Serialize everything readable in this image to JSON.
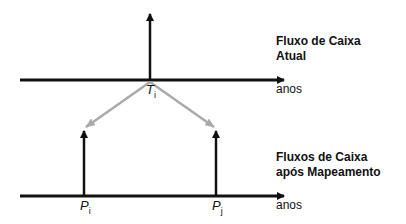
{
  "top": {
    "title_line1": "Fluxo de Caixa",
    "title_line2": "Atual",
    "axis_label": "anos",
    "point_main": "T",
    "point_sub": "i"
  },
  "bottom": {
    "title_line1": "Fluxos de Caixa",
    "title_line2": "após Mapeamento",
    "axis_label": "anos",
    "p1_main": "P",
    "p1_sub": "i",
    "p2_main": "P",
    "p2_sub": "j"
  },
  "colors": {
    "axis": "#111111",
    "mapping_arrow": "#aaaaaa"
  }
}
